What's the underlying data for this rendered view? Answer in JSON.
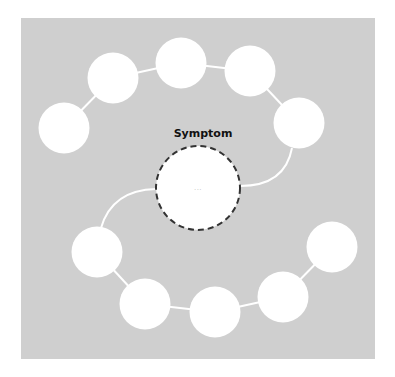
{
  "diagram": {
    "type": "cycle",
    "background_color": "#cfcfcf",
    "node_color": "#ffffff",
    "connector_color": "#ffffff",
    "center": {
      "label": "Symptom",
      "content": "...",
      "border_style": "dashed",
      "border_color": "#333333"
    },
    "nodes": [
      {
        "id": 1,
        "label": ""
      },
      {
        "id": 2,
        "label": ""
      },
      {
        "id": 3,
        "label": ""
      },
      {
        "id": 4,
        "label": ""
      },
      {
        "id": 5,
        "label": ""
      },
      {
        "id": 6,
        "label": ""
      },
      {
        "id": 7,
        "label": ""
      },
      {
        "id": 8,
        "label": ""
      },
      {
        "id": 9,
        "label": ""
      },
      {
        "id": 10,
        "label": ""
      }
    ]
  }
}
